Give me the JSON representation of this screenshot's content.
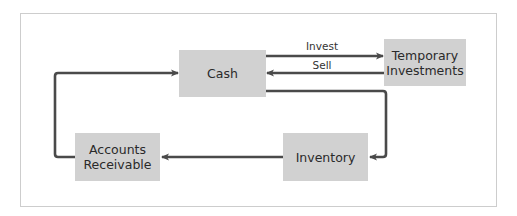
{
  "diagram": {
    "type": "flow-cycle",
    "colors": {
      "frame_border": "#cdcdcd",
      "node_fill": "#d1d1d1",
      "arrow": "#4a4a4a",
      "text": "#2a2a2a"
    },
    "nodes": {
      "cash": {
        "label": "Cash"
      },
      "temporary_investments": {
        "line1": "Temporary",
        "line2": "Investments"
      },
      "inventory": {
        "label": "Inventory"
      },
      "accounts_receivable": {
        "line1": "Accounts",
        "line2": "Receivable"
      }
    },
    "edges": {
      "invest": {
        "from": "Cash",
        "to": "Temporary Investments",
        "label": "Invest"
      },
      "sell": {
        "from": "Temporary Investments",
        "to": "Cash",
        "label": "Sell"
      },
      "cash_to_inventory": {
        "from": "Cash",
        "to": "Inventory",
        "label": ""
      },
      "inventory_to_ar": {
        "from": "Inventory",
        "to": "Accounts Receivable",
        "label": ""
      },
      "ar_to_cash": {
        "from": "Accounts Receivable",
        "to": "Cash",
        "label": ""
      }
    }
  }
}
